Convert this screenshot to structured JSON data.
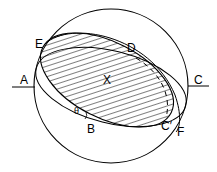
{
  "diagram": {
    "type": "geometric-construction",
    "colors": {
      "stroke": "#000000",
      "background": "#ffffff"
    },
    "labels": {
      "E": "E",
      "D": "D",
      "A": "A",
      "C": "C",
      "X": "X",
      "theta": "θ",
      "B": "B",
      "C_prime": "C′",
      "F": "F"
    }
  }
}
